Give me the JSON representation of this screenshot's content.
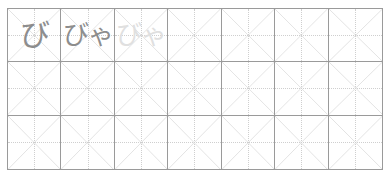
{
  "worksheet": {
    "title": "Japanese kana handwriting practice grid",
    "grid": {
      "columns": 7,
      "rows": 3,
      "cell_guides": [
        "diagonal-x",
        "dotted-cross"
      ],
      "border_color": "#9a9a9a",
      "guide_color": "#bdbdbd",
      "dotted_guide_color": "#cfcfcf",
      "background_color": "#ffffff"
    },
    "ink": {
      "dark_color": "#8d8d8d",
      "faint_color": "#e0e0e0"
    },
    "cells": [
      {
        "id": "r1c1",
        "row": 1,
        "col": 1,
        "text": "び",
        "style": "ink-dark",
        "filled": true
      },
      {
        "id": "r1c2",
        "row": 1,
        "col": 2,
        "text": "びゃ",
        "style": "ink-dark",
        "filled": true
      },
      {
        "id": "r1c3",
        "row": 1,
        "col": 3,
        "text": "びゃ",
        "style": "ink-faint",
        "filled": true
      },
      {
        "id": "r1c4",
        "row": 1,
        "col": 4,
        "text": "",
        "style": "ink-dark",
        "filled": false
      },
      {
        "id": "r1c5",
        "row": 1,
        "col": 5,
        "text": "",
        "style": "ink-dark",
        "filled": false
      },
      {
        "id": "r1c6",
        "row": 1,
        "col": 6,
        "text": "",
        "style": "ink-dark",
        "filled": false
      },
      {
        "id": "r1c7",
        "row": 1,
        "col": 7,
        "text": "",
        "style": "ink-dark",
        "filled": false
      },
      {
        "id": "r2c1",
        "row": 2,
        "col": 1,
        "text": "",
        "style": "ink-dark",
        "filled": false
      },
      {
        "id": "r2c2",
        "row": 2,
        "col": 2,
        "text": "",
        "style": "ink-dark",
        "filled": false
      },
      {
        "id": "r2c3",
        "row": 2,
        "col": 3,
        "text": "",
        "style": "ink-dark",
        "filled": false
      },
      {
        "id": "r2c4",
        "row": 2,
        "col": 4,
        "text": "",
        "style": "ink-dark",
        "filled": false
      },
      {
        "id": "r2c5",
        "row": 2,
        "col": 5,
        "text": "",
        "style": "ink-dark",
        "filled": false
      },
      {
        "id": "r2c6",
        "row": 2,
        "col": 6,
        "text": "",
        "style": "ink-dark",
        "filled": false
      },
      {
        "id": "r2c7",
        "row": 2,
        "col": 7,
        "text": "",
        "style": "ink-dark",
        "filled": false
      },
      {
        "id": "r3c1",
        "row": 3,
        "col": 1,
        "text": "",
        "style": "ink-dark",
        "filled": false
      },
      {
        "id": "r3c2",
        "row": 3,
        "col": 2,
        "text": "",
        "style": "ink-dark",
        "filled": false
      },
      {
        "id": "r3c3",
        "row": 3,
        "col": 3,
        "text": "",
        "style": "ink-dark",
        "filled": false
      },
      {
        "id": "r3c4",
        "row": 3,
        "col": 4,
        "text": "",
        "style": "ink-dark",
        "filled": false
      },
      {
        "id": "r3c5",
        "row": 3,
        "col": 5,
        "text": "",
        "style": "ink-dark",
        "filled": false
      },
      {
        "id": "r3c6",
        "row": 3,
        "col": 6,
        "text": "",
        "style": "ink-dark",
        "filled": false
      },
      {
        "id": "r3c7",
        "row": 3,
        "col": 7,
        "text": "",
        "style": "ink-dark",
        "filled": false
      }
    ]
  }
}
